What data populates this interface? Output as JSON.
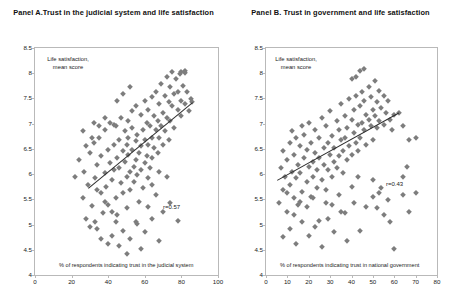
{
  "chart_data": [
    {
      "type": "scatter",
      "panel": "Panel A",
      "title": "Panel A.Trust in the judicial system and life satisfaction",
      "xlabel": "% of respondents indicating trust in the judicial system",
      "ylabel": "Life satisfaction, mean score",
      "xlim": [
        0,
        100
      ],
      "ylim": [
        4,
        8.5
      ],
      "xticks": [
        0,
        20,
        40,
        60,
        80,
        100
      ],
      "yticks": [
        4,
        4.5,
        5,
        5.5,
        6,
        6.5,
        7,
        7.5,
        8,
        8.5
      ],
      "grid": false,
      "legend": null,
      "annotation": "r=0.57",
      "correlation": 0.57,
      "marker": "diamond",
      "marker_color": "#7d7d7d",
      "trendline": {
        "x0": 29,
        "y0": 5.72,
        "x1": 86,
        "y1": 7.42,
        "color": "#2e2e2e"
      },
      "points": [
        [
          22,
          5.95
        ],
        [
          24,
          6.28
        ],
        [
          26,
          5.53
        ],
        [
          27,
          6.05
        ],
        [
          28,
          5.12
        ],
        [
          29,
          5.78
        ],
        [
          30,
          6.42
        ],
        [
          31,
          5.36
        ],
        [
          32,
          6.62
        ],
        [
          33,
          5.92
        ],
        [
          34,
          6.18
        ],
        [
          34,
          4.92
        ],
        [
          35,
          6.72
        ],
        [
          36,
          5.62
        ],
        [
          36,
          6.35
        ],
        [
          37,
          5.22
        ],
        [
          38,
          6.88
        ],
        [
          38,
          6.02
        ],
        [
          39,
          5.75
        ],
        [
          40,
          6.48
        ],
        [
          40,
          5.38
        ],
        [
          41,
          7.02
        ],
        [
          41,
          6.22
        ],
        [
          42,
          5.88
        ],
        [
          42,
          4.78
        ],
        [
          43,
          6.58
        ],
        [
          43,
          6.08
        ],
        [
          44,
          5.52
        ],
        [
          44,
          6.95
        ],
        [
          45,
          6.32
        ],
        [
          45,
          5.18
        ],
        [
          46,
          6.68
        ],
        [
          46,
          6.12
        ],
        [
          47,
          5.82
        ],
        [
          47,
          7.12
        ],
        [
          48,
          6.45
        ],
        [
          48,
          5.62
        ],
        [
          49,
          6.85
        ],
        [
          49,
          6.25
        ],
        [
          50,
          5.95
        ],
        [
          50,
          6.58
        ],
        [
          50,
          5.32
        ],
        [
          51,
          7.05
        ],
        [
          51,
          6.38
        ],
        [
          51,
          6.72
        ],
        [
          52,
          6.05
        ],
        [
          52,
          5.68
        ],
        [
          53,
          6.92
        ],
        [
          53,
          6.48
        ],
        [
          53,
          7.25
        ],
        [
          54,
          6.15
        ],
        [
          54,
          5.85
        ],
        [
          55,
          6.65
        ],
        [
          55,
          7.35
        ],
        [
          55,
          6.28
        ],
        [
          56,
          5.98
        ],
        [
          56,
          6.78
        ],
        [
          57,
          6.42
        ],
        [
          57,
          5.45
        ],
        [
          58,
          7.18
        ],
        [
          58,
          6.55
        ],
        [
          58,
          6.08
        ],
        [
          59,
          6.88
        ],
        [
          59,
          5.72
        ],
        [
          60,
          7.45
        ],
        [
          60,
          6.68
        ],
        [
          60,
          6.22
        ],
        [
          61,
          7.02
        ],
        [
          61,
          6.35
        ],
        [
          62,
          5.92
        ],
        [
          62,
          7.28
        ],
        [
          62,
          6.58
        ],
        [
          63,
          6.95
        ],
        [
          63,
          6.12
        ],
        [
          64,
          7.52
        ],
        [
          64,
          6.72
        ],
        [
          64,
          6.32
        ],
        [
          65,
          7.15
        ],
        [
          65,
          6.52
        ],
        [
          66,
          6.88
        ],
        [
          66,
          7.62
        ],
        [
          67,
          7.05
        ],
        [
          67,
          6.42
        ],
        [
          68,
          7.38
        ],
        [
          68,
          6.72
        ],
        [
          69,
          7.78
        ],
        [
          69,
          6.95
        ],
        [
          70,
          7.22
        ],
        [
          70,
          6.58
        ],
        [
          71,
          7.55
        ],
        [
          71,
          6.85
        ],
        [
          72,
          7.92
        ],
        [
          72,
          7.12
        ],
        [
          73,
          7.42
        ],
        [
          73,
          6.68
        ],
        [
          74,
          7.72
        ],
        [
          74,
          7.05
        ],
        [
          75,
          8.02
        ],
        [
          75,
          7.35
        ],
        [
          76,
          7.58
        ],
        [
          76,
          6.92
        ],
        [
          77,
          7.88
        ],
        [
          78,
          7.28
        ],
        [
          78,
          7.62
        ],
        [
          79,
          7.98
        ],
        [
          80,
          7.45
        ],
        [
          80,
          7.15
        ],
        [
          81,
          7.75
        ],
        [
          82,
          8.05
        ],
        [
          82,
          7.38
        ],
        [
          83,
          7.62
        ],
        [
          84,
          7.25
        ],
        [
          85,
          7.48
        ],
        [
          86,
          7.42
        ],
        [
          80,
          8.02
        ],
        [
          82,
          8.0
        ],
        [
          30,
          4.95
        ],
        [
          33,
          5.05
        ],
        [
          36,
          4.72
        ],
        [
          40,
          4.62
        ],
        [
          44,
          5.05
        ],
        [
          48,
          4.88
        ],
        [
          52,
          4.72
        ],
        [
          56,
          5.02
        ],
        [
          60,
          4.85
        ],
        [
          64,
          5.12
        ],
        [
          68,
          4.68
        ],
        [
          58,
          4.52
        ],
        [
          50,
          4.42
        ],
        [
          46,
          4.58
        ],
        [
          42,
          5.25
        ],
        [
          38,
          5.45
        ],
        [
          34,
          5.68
        ],
        [
          31,
          6.72
        ],
        [
          28,
          6.55
        ],
        [
          26,
          6.85
        ],
        [
          45,
          7.45
        ],
        [
          48,
          7.58
        ],
        [
          52,
          7.72
        ],
        [
          43,
          6.98
        ],
        [
          38,
          7.12
        ],
        [
          35,
          6.95
        ],
        [
          32,
          7.02
        ],
        [
          55,
          5.05
        ],
        [
          62,
          5.35
        ],
        [
          66,
          5.58
        ],
        [
          70,
          5.25
        ],
        [
          74,
          5.42
        ],
        [
          78,
          5.08
        ],
        [
          72,
          5.95
        ],
        [
          68,
          6.05
        ],
        [
          64,
          5.78
        ]
      ]
    },
    {
      "type": "scatter",
      "panel": "Panel B",
      "title": "Panel B. Trust in government and  life satisfaction",
      "xlabel": "% of respondents indicating trust in national government",
      "ylabel": "Life satisfaction, mean score",
      "xlim": [
        0,
        80
      ],
      "ylim": [
        4,
        8.5
      ],
      "xticks": [
        0,
        10,
        20,
        30,
        40,
        50,
        60,
        70,
        80
      ],
      "yticks": [
        4,
        4.5,
        5,
        5.5,
        6,
        6.5,
        7,
        7.5,
        8,
        8.5
      ],
      "grid": false,
      "legend": null,
      "annotation": "r=0.43",
      "correlation": 0.43,
      "marker": "diamond",
      "marker_color": "#7d7d7d",
      "trendline": {
        "x0": 5,
        "y0": 5.88,
        "x1": 62,
        "y1": 7.22,
        "color": "#2e2e2e"
      },
      "points": [
        [
          6,
          5.42
        ],
        [
          7,
          6.12
        ],
        [
          8,
          5.68
        ],
        [
          8,
          6.45
        ],
        [
          9,
          5.95
        ],
        [
          10,
          6.28
        ],
        [
          10,
          5.25
        ],
        [
          11,
          6.62
        ],
        [
          11,
          5.78
        ],
        [
          12,
          6.05
        ],
        [
          12,
          6.85
        ],
        [
          13,
          5.52
        ],
        [
          13,
          6.38
        ],
        [
          14,
          6.72
        ],
        [
          14,
          5.92
        ],
        [
          15,
          6.18
        ],
        [
          15,
          5.38
        ],
        [
          16,
          6.55
        ],
        [
          16,
          6.02
        ],
        [
          17,
          6.95
        ],
        [
          17,
          5.65
        ],
        [
          18,
          6.32
        ],
        [
          18,
          6.78
        ],
        [
          19,
          5.85
        ],
        [
          19,
          6.48
        ],
        [
          20,
          6.15
        ],
        [
          20,
          7.02
        ],
        [
          21,
          5.55
        ],
        [
          21,
          6.62
        ],
        [
          22,
          6.25
        ],
        [
          22,
          5.95
        ],
        [
          23,
          6.88
        ],
        [
          23,
          6.42
        ],
        [
          24,
          5.72
        ],
        [
          24,
          6.08
        ],
        [
          25,
          6.72
        ],
        [
          25,
          6.32
        ],
        [
          26,
          5.88
        ],
        [
          26,
          7.12
        ],
        [
          27,
          6.52
        ],
        [
          27,
          6.18
        ],
        [
          28,
          5.42
        ],
        [
          28,
          6.95
        ],
        [
          29,
          6.62
        ],
        [
          29,
          6.08
        ],
        [
          30,
          6.38
        ],
        [
          30,
          7.25
        ],
        [
          31,
          5.95
        ],
        [
          31,
          6.75
        ],
        [
          32,
          6.25
        ],
        [
          32,
          6.52
        ],
        [
          33,
          7.05
        ],
        [
          33,
          6.12
        ],
        [
          34,
          6.88
        ],
        [
          34,
          6.35
        ],
        [
          35,
          6.68
        ],
        [
          35,
          7.38
        ],
        [
          36,
          6.02
        ],
        [
          36,
          6.45
        ],
        [
          37,
          7.15
        ],
        [
          37,
          6.72
        ],
        [
          38,
          6.28
        ],
        [
          38,
          6.92
        ],
        [
          39,
          7.48
        ],
        [
          39,
          6.55
        ],
        [
          40,
          7.08
        ],
        [
          40,
          6.38
        ],
        [
          41,
          6.82
        ],
        [
          41,
          7.28
        ],
        [
          42,
          6.62
        ],
        [
          42,
          7.55
        ],
        [
          43,
          6.98
        ],
        [
          43,
          6.45
        ],
        [
          44,
          7.35
        ],
        [
          44,
          6.72
        ],
        [
          45,
          7.62
        ],
        [
          45,
          7.02
        ],
        [
          46,
          6.88
        ],
        [
          46,
          7.45
        ],
        [
          47,
          7.18
        ],
        [
          47,
          6.58
        ],
        [
          48,
          7.72
        ],
        [
          48,
          7.08
        ],
        [
          49,
          6.95
        ],
        [
          49,
          7.52
        ],
        [
          50,
          7.28
        ],
        [
          50,
          6.68
        ],
        [
          51,
          7.85
        ],
        [
          51,
          7.15
        ],
        [
          52,
          7.42
        ],
        [
          52,
          6.92
        ],
        [
          53,
          7.65
        ],
        [
          53,
          7.05
        ],
        [
          54,
          7.32
        ],
        [
          55,
          7.55
        ],
        [
          55,
          6.98
        ],
        [
          56,
          7.22
        ],
        [
          57,
          7.45
        ],
        [
          58,
          7.08
        ],
        [
          59,
          6.88
        ],
        [
          60,
          7.18
        ],
        [
          62,
          7.22
        ],
        [
          64,
          6.95
        ],
        [
          67,
          6.68
        ],
        [
          70,
          6.72
        ],
        [
          44,
          8.05
        ],
        [
          46,
          8.08
        ],
        [
          42,
          7.92
        ],
        [
          40,
          7.88
        ],
        [
          8,
          4.75
        ],
        [
          11,
          4.92
        ],
        [
          14,
          4.62
        ],
        [
          17,
          5.05
        ],
        [
          20,
          4.78
        ],
        [
          23,
          4.95
        ],
        [
          26,
          4.55
        ],
        [
          29,
          5.12
        ],
        [
          32,
          4.85
        ],
        [
          35,
          5.25
        ],
        [
          38,
          4.68
        ],
        [
          41,
          5.42
        ],
        [
          44,
          4.88
        ],
        [
          47,
          5.35
        ],
        [
          50,
          5.55
        ],
        [
          53,
          5.62
        ],
        [
          55,
          5.18
        ],
        [
          57,
          5.48
        ],
        [
          58,
          5.05
        ],
        [
          60,
          4.52
        ],
        [
          10,
          5.62
        ],
        [
          13,
          5.18
        ],
        [
          16,
          5.45
        ],
        [
          19,
          5.35
        ],
        [
          22,
          5.52
        ],
        [
          25,
          5.08
        ],
        [
          28,
          5.68
        ],
        [
          31,
          5.38
        ],
        [
          34,
          5.58
        ],
        [
          37,
          5.22
        ],
        [
          40,
          5.75
        ],
        [
          43,
          5.95
        ],
        [
          50,
          5.88
        ],
        [
          52,
          5.32
        ],
        [
          54,
          5.72
        ],
        [
          64,
          5.58
        ],
        [
          67,
          5.25
        ],
        [
          70,
          5.62
        ],
        [
          66,
          6.15
        ],
        [
          64,
          5.95
        ]
      ]
    }
  ]
}
